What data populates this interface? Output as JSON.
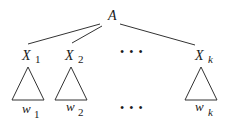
{
  "diagram": {
    "root": {
      "label": "A"
    },
    "children": [
      {
        "var": "X",
        "sub": "1",
        "leaf_var": "w",
        "leaf_sub": "1"
      },
      {
        "var": "X",
        "sub": "2",
        "leaf_var": "w",
        "leaf_sub": "2"
      },
      {
        "var": "X",
        "sub": "k",
        "leaf_var": "w",
        "leaf_sub": "k"
      }
    ],
    "ellipsis_top": "• • •",
    "ellipsis_bottom": "• • •",
    "line_color": "#333333",
    "text_color": "#1a1a1a"
  }
}
